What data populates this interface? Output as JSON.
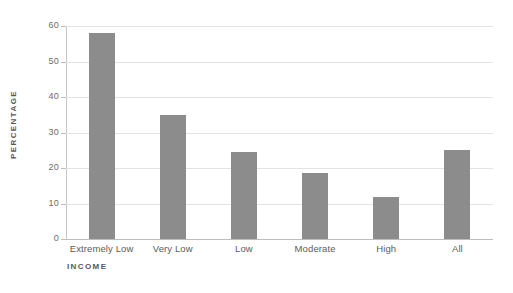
{
  "chart_data": {
    "type": "bar",
    "title": "",
    "xlabel": "INCOME",
    "ylabel": "PERCENTAGE",
    "categories": [
      "Extremely Low",
      "Very Low",
      "Low",
      "Moderate",
      "High",
      "All"
    ],
    "values": [
      58,
      34.8,
      24.6,
      18.6,
      11.7,
      25
    ],
    "ylim": [
      0,
      60
    ],
    "yticks": [
      0,
      10,
      20,
      30,
      40,
      50,
      60
    ],
    "ytick_labels": [
      "0",
      "10",
      "20",
      "30",
      "40",
      "50",
      "60"
    ],
    "grid": true,
    "legend": "none",
    "series": [
      {
        "name": "Percentage",
        "color": "#8c8c8c",
        "values": [
          58,
          34.8,
          24.6,
          18.6,
          11.7,
          25
        ]
      }
    ],
    "colors": {
      "bar": "#8c8c8c",
      "gridline": "#e3e3e3",
      "axis": "#bdbdbd",
      "text": "#5c5c5c",
      "background": "#ffffff"
    }
  }
}
